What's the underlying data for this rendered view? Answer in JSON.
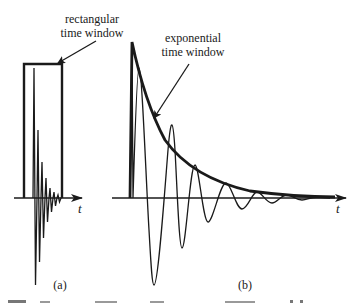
{
  "figure": {
    "panel_a": {
      "label": "(a)",
      "axis_label": "t",
      "annotation_line1": "rectangular",
      "annotation_line2": "time window",
      "description": "Rapidly decaying oscillating signal with rectangular time window"
    },
    "panel_b": {
      "label": "(b)",
      "axis_label": "t",
      "annotation_line1": "exponential",
      "annotation_line2": "time window",
      "description": "Slowly decaying oscillating signal with exponential time window envelope"
    },
    "caption_partial": "(caption text cut off at bottom)"
  },
  "colors": {
    "ink": "#1a1a1a",
    "background": "#ffffff"
  }
}
